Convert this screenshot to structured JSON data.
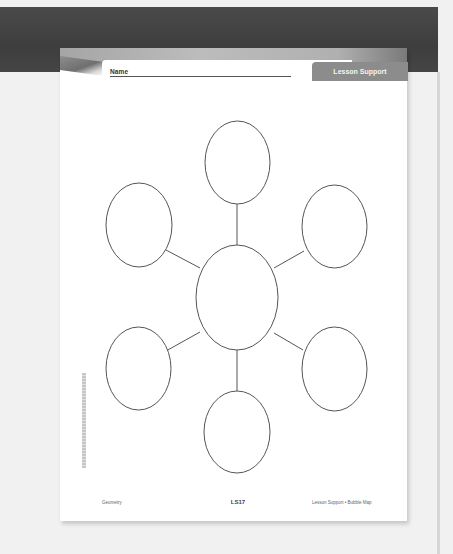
{
  "worksheet": {
    "header": {
      "name_label": "Name",
      "section_tab": "Lesson Support"
    },
    "diagram": {
      "type": "bubble-map",
      "bubbles": [
        {
          "id": "center",
          "text": ""
        },
        {
          "id": "top",
          "text": ""
        },
        {
          "id": "upper-left",
          "text": ""
        },
        {
          "id": "upper-right",
          "text": ""
        },
        {
          "id": "lower-left",
          "text": ""
        },
        {
          "id": "lower-right",
          "text": ""
        },
        {
          "id": "bottom",
          "text": ""
        }
      ]
    },
    "footer": {
      "subject": "Geometry",
      "page_code": "LS17",
      "title": "Lesson Support • Bubble Map"
    }
  },
  "colors": {
    "backdrop_band": "#414141",
    "tab_gray": "#8c8c8c",
    "line": "#555555"
  }
}
